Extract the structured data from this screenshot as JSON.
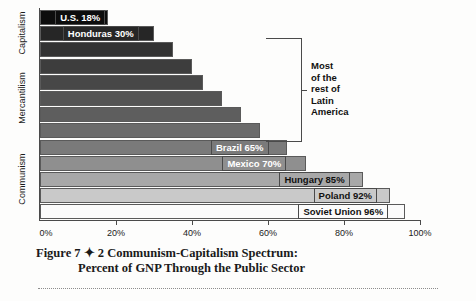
{
  "figure": {
    "caption_line1": "Figure 7 ✦ 2 Communism-Capitalism Spectrum:",
    "caption_line2": "Percent of GNP Through the Public Sector"
  },
  "callout": {
    "line1": "Most",
    "line2": "of the",
    "line3": "rest of",
    "line4": "Latin",
    "line5": "America"
  },
  "axis": {
    "categories": [
      "Capitalism",
      "Mercantilism",
      "Communism"
    ],
    "x_ticks": [
      "0%",
      "20%",
      "40%",
      "60%",
      "80%",
      "100%"
    ]
  },
  "chart_data": {
    "type": "bar",
    "orientation": "horizontal",
    "title": "Figure 7 ✦ 2 Communism-Capitalism Spectrum: Percent of GNP Through the Public Sector",
    "xlabel": "Percent of GNP Through the Public Sector",
    "ylabel": "",
    "xlim": [
      0,
      100
    ],
    "xticks": [
      0,
      20,
      40,
      60,
      80,
      100
    ],
    "xtick_labels": [
      "0%",
      "20%",
      "40%",
      "60%",
      "80%",
      "100%"
    ],
    "grid": false,
    "legend": "none",
    "category_axis_groups": [
      "Capitalism",
      "Mercantilism",
      "Communism"
    ],
    "annotations": [
      "Most of the rest of Latin America"
    ],
    "categories": [
      "U.S.",
      "Honduras",
      "",
      "",
      "",
      "",
      "",
      "",
      "Brazil",
      "Mexico",
      "Hungary",
      "Poland",
      "Soviet Union"
    ],
    "bars": [
      {
        "label": "U.S.",
        "value": 18,
        "tag": "U.S.  18%",
        "fill": "#0d0d0d",
        "tag_fill": "#0d0d0d",
        "tag_text": "light",
        "tag_left_pct": 4
      },
      {
        "label": "Honduras",
        "value": 30,
        "tag": "Honduras  30%",
        "fill": "#262626",
        "tag_fill": "#262626",
        "tag_text": "light",
        "tag_left_pct": 6
      },
      {
        "label": "",
        "value": 35,
        "tag": "",
        "fill": "#333333",
        "tag_fill": "",
        "tag_text": "",
        "tag_left_pct": 0
      },
      {
        "label": "",
        "value": 40,
        "tag": "",
        "fill": "#3d3d3d",
        "tag_fill": "",
        "tag_text": "",
        "tag_left_pct": 0
      },
      {
        "label": "",
        "value": 43,
        "tag": "",
        "fill": "#474747",
        "tag_fill": "",
        "tag_text": "",
        "tag_left_pct": 0
      },
      {
        "label": "",
        "value": 48,
        "tag": "",
        "fill": "#545454",
        "tag_fill": "",
        "tag_text": "",
        "tag_left_pct": 0
      },
      {
        "label": "",
        "value": 53,
        "tag": "",
        "fill": "#5e5e5e",
        "tag_fill": "",
        "tag_text": "",
        "tag_left_pct": 0
      },
      {
        "label": "",
        "value": 58,
        "tag": "",
        "fill": "#6b6b6b",
        "tag_fill": "",
        "tag_text": "",
        "tag_left_pct": 0
      },
      {
        "label": "Brazil",
        "value": 65,
        "tag": "Brazil  65%",
        "fill": "#7a7a7a",
        "tag_fill": "#7a7a7a",
        "tag_text": "light",
        "tag_left_pct": 45
      },
      {
        "label": "Mexico",
        "value": 70,
        "tag": "Mexico  70%",
        "fill": "#8f8f8f",
        "tag_fill": "#8f8f8f",
        "tag_text": "light",
        "tag_left_pct": 48
      },
      {
        "label": "Hungary",
        "value": 85,
        "tag": "Hungary  85%",
        "fill": "#a8a8a8",
        "tag_fill": "#a8a8a8",
        "tag_text": "dark",
        "tag_left_pct": 63
      },
      {
        "label": "Poland",
        "value": 92,
        "tag": "Poland  92%",
        "fill": "#c9c9c9",
        "tag_fill": "#c9c9c9",
        "tag_text": "dark",
        "tag_left_pct": 72
      },
      {
        "label": "Soviet Union",
        "value": 96,
        "tag": "Soviet Union  96%",
        "fill": "#fbfbfb",
        "tag_fill": "#fbfbfb",
        "tag_text": "dark",
        "tag_left_pct": 68
      }
    ]
  }
}
